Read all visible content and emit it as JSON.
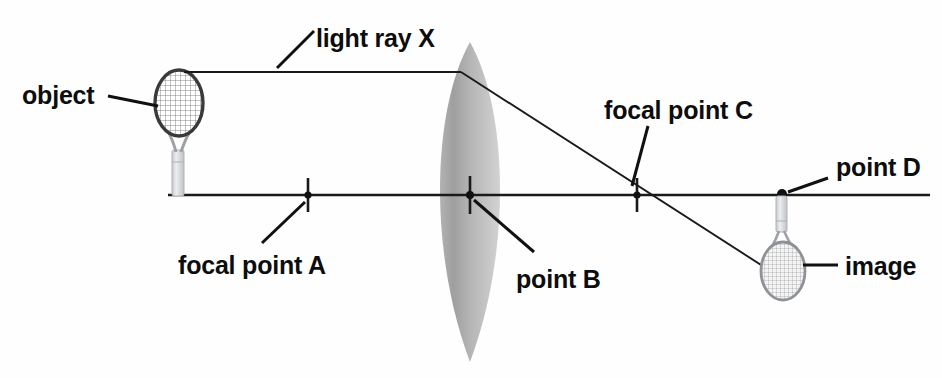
{
  "diagram": {
    "background_color": "#fefefe",
    "line_color": "#1a1a1a",
    "lens_color": "#a9a9a9",
    "racket_frame_color": "#3a3a3a",
    "racket_handle_color": "#d8dade"
  },
  "labels": {
    "object": "object",
    "light_ray_x": "light ray X",
    "focal_point_c": "focal point C",
    "point_d": "point D",
    "focal_point_a": "focal point A",
    "point_b": "point B",
    "image": "image"
  },
  "geometry": {
    "optical_axis_y": 195,
    "axis_x_start": 168,
    "axis_x_end": 930,
    "lens_center_x": 470,
    "lens_top_y": 42,
    "lens_bottom_y": 362,
    "lens_half_width": 42,
    "focal_point_a_x": 308,
    "point_b_x": 470,
    "focal_point_c_x": 637,
    "point_d_x": 782,
    "ray_x_y": 72,
    "object_head_center": [
      178,
      105
    ],
    "image_head_center": [
      783,
      267
    ]
  }
}
